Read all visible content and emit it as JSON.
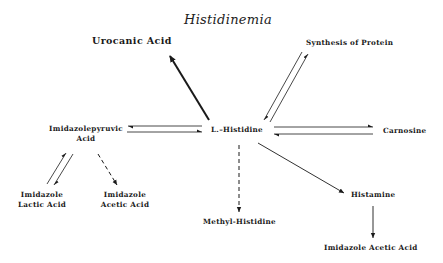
{
  "title": "Histidinemia",
  "nodes": {
    "urocanic_acid": "Urocanic Acid",
    "synthesis_of_protein": "Synthesis of Protein",
    "imidazolepyruvic_acid_line1": "Imidazolepyruvic",
    "imidazolepyruvic_acid_line2": "Acid",
    "l_histidine": "L.–Histidine",
    "carnosine": "Carnosine",
    "imidazole_lactic_acid_line1": "Imidazole",
    "imidazole_lactic_acid_line2": "Lactic Acid",
    "imidazole_acetic_acid_left_line1": "Imidazole",
    "imidazole_acetic_acid_left_line2": "Acetic Acid",
    "methyl_histidine": "Methyl-Histidine",
    "histamine": "Histamine",
    "imidazole_acetic_acid_right": "Imidazole Acetic Acid"
  },
  "edges": [
    {
      "from": "L.-Histidine",
      "to": "Urocanic Acid",
      "style": "bold-single"
    },
    {
      "from": "L.-Histidine",
      "to": "Synthesis of Protein",
      "style": "reversible"
    },
    {
      "from": "L.-Histidine",
      "to": "Imidazolepyruvic Acid",
      "style": "reversible"
    },
    {
      "from": "L.-Histidine",
      "to": "Carnosine",
      "style": "reversible"
    },
    {
      "from": "L.-Histidine",
      "to": "Methyl-Histidine",
      "style": "dashed"
    },
    {
      "from": "L.-Histidine",
      "to": "Histamine",
      "style": "single"
    },
    {
      "from": "Histamine",
      "to": "Imidazole Acetic Acid",
      "style": "single"
    },
    {
      "from": "Imidazolepyruvic Acid",
      "to": "Imidazole Lactic Acid",
      "style": "reversible"
    },
    {
      "from": "Imidazolepyruvic Acid",
      "to": "Imidazole Acetic Acid",
      "style": "dashed"
    }
  ],
  "colors": {
    "ink": "#1a1a1a",
    "background": "#ffffff"
  }
}
